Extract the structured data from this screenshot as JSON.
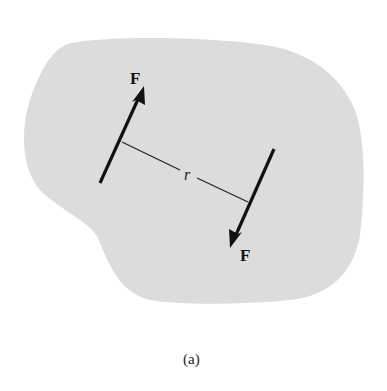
{
  "figure": {
    "caption": "(a)",
    "body_fill": "#dcdcdc",
    "line_color": "#111111",
    "forces": [
      {
        "label": "F",
        "direction": "up-right",
        "tail": [
          100,
          183
        ],
        "tip": [
          143,
          87
        ]
      },
      {
        "label": "F",
        "direction": "down-left",
        "tail": [
          274,
          149
        ],
        "tip": [
          231,
          247
        ]
      }
    ],
    "moment_arm": {
      "label": "r",
      "from": [
        122,
        142
      ],
      "to": [
        248,
        202
      ]
    }
  }
}
